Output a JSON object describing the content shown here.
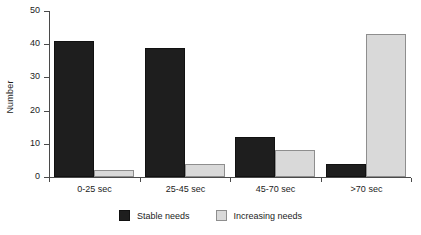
{
  "chart_data": {
    "type": "bar",
    "title": "",
    "xlabel": "",
    "ylabel": "Number",
    "categories": [
      "0-25 sec",
      "25-45 sec",
      "45-70 sec",
      ">70 sec"
    ],
    "series": [
      {
        "name": "Stable needs",
        "color": "#1e1e1e",
        "values": [
          41,
          39,
          12,
          4
        ]
      },
      {
        "name": "Increasing needs",
        "color": "#d9d9d9",
        "values": [
          2,
          4,
          8,
          43
        ]
      }
    ],
    "ylim": [
      0,
      50
    ],
    "yticks": [
      0,
      10,
      20,
      30,
      40,
      50
    ],
    "ytick_labels": [
      "0",
      "10",
      "20",
      "30",
      "40",
      "50"
    ],
    "grid": false,
    "legend_position": "bottom"
  }
}
